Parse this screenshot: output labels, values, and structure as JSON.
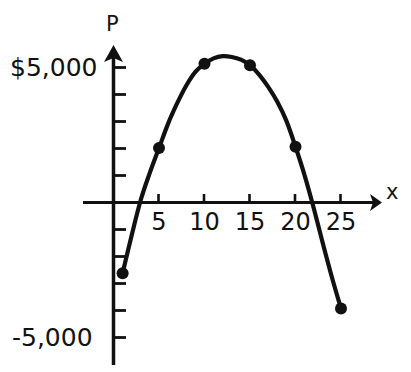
{
  "chart_data": {
    "type": "line",
    "title": "",
    "subtitle": "",
    "xlabel": "x",
    "ylabel": "P",
    "grid": false,
    "legend": "none",
    "xlim": [
      -2,
      27
    ],
    "ylim": [
      -5600,
      5600
    ],
    "x_ticks": [
      5,
      10,
      15,
      20,
      25
    ],
    "x_tick_labels": [
      "5",
      "10",
      "15",
      "20",
      "25"
    ],
    "y_ticks": [
      -5000,
      -4000,
      -3000,
      -2000,
      -1000,
      1000,
      2000,
      3000,
      4000,
      5000
    ],
    "y_tick_labels_shown": [
      "$5,000",
      "-5,000"
    ],
    "y_axis_top_label": "$5,000",
    "y_axis_bottom_label": "-5,000",
    "series": [
      {
        "name": "P",
        "marked_points": {
          "x": [
            1,
            5,
            10,
            15,
            20,
            25
          ],
          "y": [
            -2600,
            2000,
            5100,
            5050,
            2050,
            -3900
          ]
        },
        "curve": {
          "x": [
            1,
            2,
            3,
            4,
            5,
            6,
            7,
            8,
            9,
            10,
            11,
            12,
            13,
            14,
            15,
            16,
            17,
            18,
            19,
            20,
            21,
            22,
            23,
            24,
            25
          ],
          "y": [
            -2600,
            -1200,
            100,
            1100,
            2000,
            2900,
            3650,
            4300,
            4800,
            5100,
            5300,
            5380,
            5350,
            5250,
            5050,
            4700,
            4250,
            3700,
            3000,
            2050,
            1000,
            -200,
            -1500,
            -2750,
            -3900
          ]
        }
      }
    ]
  },
  "axis_markers": {
    "x_arrow": "arrow-right",
    "y_arrow": "arrow-up"
  }
}
